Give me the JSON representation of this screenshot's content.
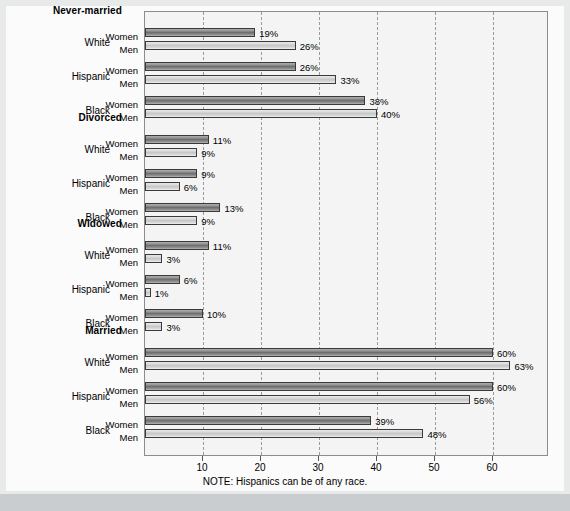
{
  "note": "NOTE: Hispanics can be of any race.",
  "colors": {
    "women_bar": "#7a7a7a",
    "men_bar": "#d5d5d5",
    "bar_border": "#3a3a3a",
    "plot_background": "#f4f4f4",
    "page_background": "#fbfbfb",
    "gridline": "#9a9a9a",
    "footer_band": "#c9cdd0"
  },
  "series_labels": {
    "women": "Women",
    "men": "Men"
  },
  "chart_data": {
    "type": "bar",
    "orientation": "horizontal",
    "title": "",
    "subtitle": "",
    "xlabel": "",
    "ylabel": "",
    "xlim": [
      0,
      65
    ],
    "xticks": [
      10,
      20,
      30,
      40,
      50,
      60
    ],
    "xtick_labels": [
      "10",
      "20",
      "30",
      "40",
      "50",
      "60"
    ],
    "grid": true,
    "grid_axis": "x",
    "grid_style": "dashed",
    "legend": "none",
    "value_label_suffix": "%",
    "series": [
      {
        "name": "Women",
        "values": [
          19,
          26,
          38,
          11,
          9,
          13,
          11,
          6,
          10,
          60,
          60,
          39
        ]
      },
      {
        "name": "Men",
        "values": [
          26,
          33,
          40,
          9,
          6,
          9,
          3,
          1,
          3,
          63,
          56,
          48
        ]
      }
    ],
    "groups": [
      {
        "label": "Never-married",
        "rows": [
          {
            "race": "White",
            "women": 19,
            "men": 26,
            "women_label": "19%",
            "men_label": "26%"
          },
          {
            "race": "Hispanic",
            "women": 26,
            "men": 33,
            "women_label": "26%",
            "men_label": "33%"
          },
          {
            "race": "Black",
            "women": 38,
            "men": 40,
            "women_label": "38%",
            "men_label": "40%"
          }
        ]
      },
      {
        "label": "Divorced",
        "rows": [
          {
            "race": "White",
            "women": 11,
            "men": 9,
            "women_label": "11%",
            "men_label": "9%"
          },
          {
            "race": "Hispanic",
            "women": 9,
            "men": 6,
            "women_label": "9%",
            "men_label": "6%"
          },
          {
            "race": "Black",
            "women": 13,
            "men": 9,
            "women_label": "13%",
            "men_label": "9%"
          }
        ]
      },
      {
        "label": "Widowed",
        "rows": [
          {
            "race": "White",
            "women": 11,
            "men": 3,
            "women_label": "11%",
            "men_label": "3%"
          },
          {
            "race": "Hispanic",
            "women": 6,
            "men": 1,
            "women_label": "6%",
            "men_label": "1%"
          },
          {
            "race": "Black",
            "women": 10,
            "men": 3,
            "women_label": "10%",
            "men_label": "3%"
          }
        ]
      },
      {
        "label": "Married",
        "rows": [
          {
            "race": "White",
            "women": 60,
            "men": 63,
            "women_label": "60%",
            "men_label": "63%"
          },
          {
            "race": "Hispanic",
            "women": 60,
            "men": 56,
            "women_label": "60%",
            "men_label": "56%"
          },
          {
            "race": "Black",
            "women": 39,
            "men": 48,
            "women_label": "39%",
            "men_label": "48%"
          }
        ]
      }
    ]
  }
}
